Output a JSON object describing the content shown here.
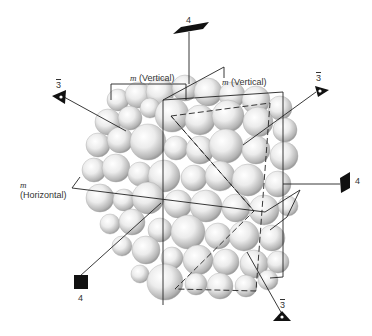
{
  "figure": {
    "labels": {
      "mirror_vertical_1": {
        "m": "m",
        "text": "(Vertical)"
      },
      "mirror_vertical_2": {
        "m": "m",
        "text": "(Vertical)"
      },
      "mirror_horizontal": {
        "m": "m",
        "text": "(Horizontal)"
      },
      "axis_4_top": "4",
      "axis_4_right": "4",
      "axis_4_front": "4",
      "axis_3bar_left": "3",
      "axis_3bar_right": "3",
      "axis_3bar_bottom": "3"
    },
    "colors": {
      "line": "#222222",
      "marker": "#111111",
      "sphere_light": "#f4f4f4",
      "sphere_dark": "#9a9a9a",
      "label": "#333333"
    }
  }
}
